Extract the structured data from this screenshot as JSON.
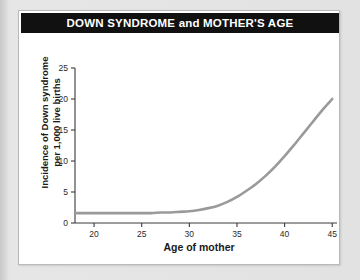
{
  "card": {
    "title": "DOWN SYNDROME and MOTHER'S AGE",
    "title_bar_color": "#111111",
    "title_text_color": "#ffffff",
    "background_color": "#ffffff",
    "page_background_color": "#e3e3e3"
  },
  "chart_data": {
    "type": "line",
    "title": "DOWN SYNDROME and MOTHER'S AGE",
    "xlabel": "Age of mother",
    "ylabel": "Incidence of Down syndrome per 1,000 live births",
    "ylabel_line1": "Incidence of Down syndrome",
    "ylabel_line2": "per 1,000 live births",
    "xlim": [
      18,
      45.5
    ],
    "ylim": [
      0,
      25
    ],
    "xticks": [
      20,
      25,
      30,
      35,
      40,
      45
    ],
    "yticks": [
      0,
      5,
      10,
      15,
      20,
      25
    ],
    "xtick_labels": [
      "20",
      "25",
      "30",
      "35",
      "40",
      "45"
    ],
    "ytick_labels": [
      "0",
      "5",
      "10",
      "15",
      "20",
      "25"
    ],
    "grid": false,
    "legend": false,
    "line_color": "#9a9a9a",
    "line_width": 2.6,
    "series": [
      {
        "name": "Incidence of Down syndrome per 1,000 live births",
        "x": [
          18,
          20,
          22,
          24,
          25,
          26,
          27,
          28,
          29,
          30,
          31,
          32,
          33,
          34,
          35,
          36,
          37,
          38,
          39,
          40,
          41,
          42,
          43,
          44,
          45
        ],
        "values": [
          1.6,
          1.6,
          1.6,
          1.6,
          1.6,
          1.6,
          1.7,
          1.7,
          1.8,
          1.9,
          2.1,
          2.4,
          2.8,
          3.4,
          4.2,
          5.2,
          6.3,
          7.6,
          9.1,
          10.8,
          12.6,
          14.5,
          16.4,
          18.3,
          20.0
        ]
      }
    ]
  }
}
